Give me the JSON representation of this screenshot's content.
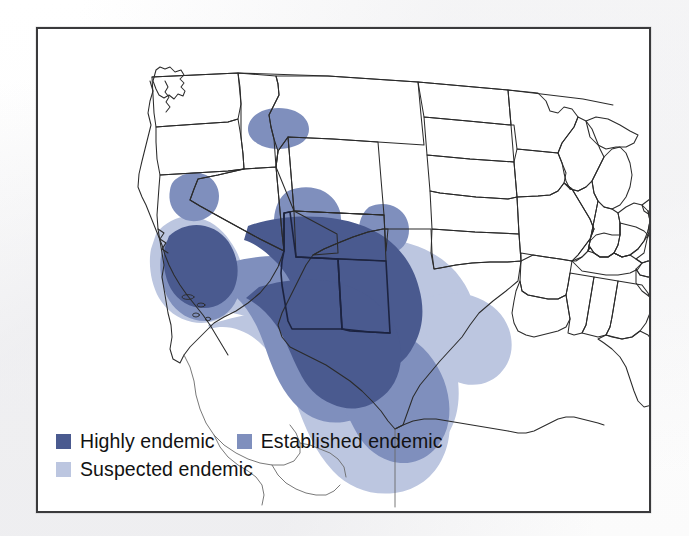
{
  "figure": {
    "kind": "choropleth-map",
    "region": "Continental United States",
    "border_color": "#3a3a3c",
    "background_color": "#ffffff",
    "state_outline_color": "#2b2b2b",
    "endemic_outline_color": "#1c2340"
  },
  "legend": {
    "rows": [
      {
        "entries": [
          {
            "label": "Highly endemic",
            "color": "#4a5a8f",
            "swatch_name": "highly-endemic-swatch"
          },
          {
            "label": "Established endemic",
            "color": "#7f8fbd",
            "swatch_name": "established-endemic-swatch"
          }
        ]
      },
      {
        "entries": [
          {
            "label": "Suspected endemic",
            "color": "#bcc6e0",
            "swatch_name": "suspected-endemic-swatch"
          }
        ]
      }
    ]
  },
  "map_data": {
    "type": "choropleth",
    "classes": [
      {
        "name": "Suspected endemic",
        "color": "#bcc6e0",
        "level": 1
      },
      {
        "name": "Established endemic",
        "color": "#7f8fbd",
        "level": 2
      },
      {
        "name": "Highly endemic",
        "color": "#4a5a8f",
        "level": 3
      }
    ],
    "regions": [
      {
        "class": "Suspected endemic",
        "areas": [
          "Southern California",
          "Southern Nevada",
          "Southern Utah",
          "Arizona",
          "New Mexico",
          "West Texas",
          "South Texas",
          "Northern Mexico border belt"
        ]
      },
      {
        "class": "Established endemic",
        "areas": [
          "Central California (San Joaquin Valley)",
          "Southern Arizona",
          "Southern New Mexico",
          "Far West Texas",
          "Rio Grande Valley Texas",
          "South-central Washington (small focus)",
          "Northern California (small focus)",
          "South-central Utah (small focus)"
        ]
      },
      {
        "class": "Highly endemic",
        "areas": [
          "San Joaquin Valley California",
          "South-central Arizona (Phoenix-Tucson corridor)"
        ]
      }
    ],
    "highlighted_states_outlined": [
      "Arizona",
      "New Mexico"
    ]
  }
}
